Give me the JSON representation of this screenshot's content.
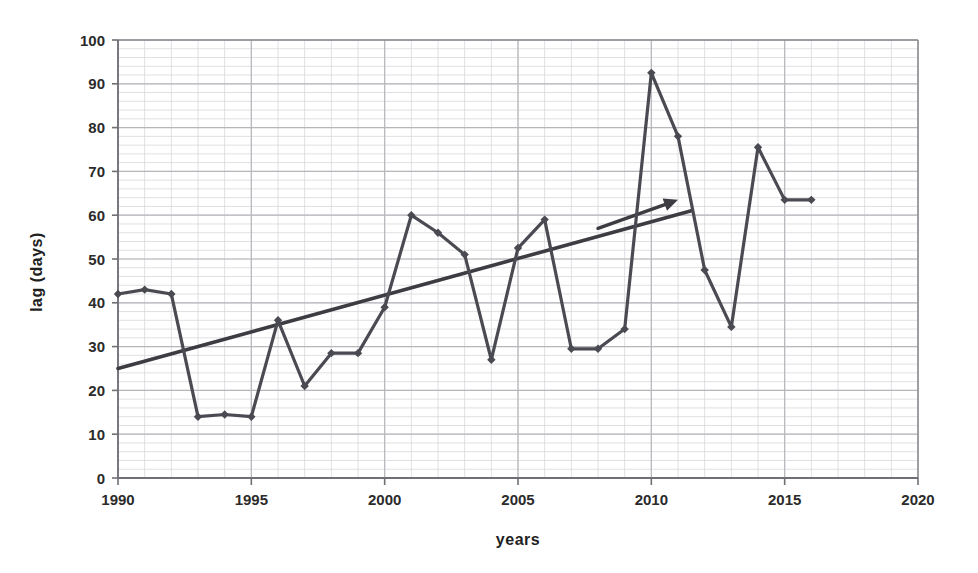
{
  "chart_data": {
    "type": "line",
    "title": "",
    "xlabel": "years",
    "ylabel": "lag (days)",
    "xlim": [
      1990,
      2020
    ],
    "ylim": [
      0,
      100
    ],
    "xticks": [
      1990,
      1995,
      2000,
      2005,
      2010,
      2015,
      2020
    ],
    "yticks": [
      0,
      10,
      20,
      30,
      40,
      50,
      60,
      70,
      80,
      90,
      100
    ],
    "grid": true,
    "legend": "none",
    "x": [
      1990,
      1991,
      1992,
      1993,
      1994,
      1995,
      1996,
      1997,
      1998,
      1999,
      2000,
      2001,
      2002,
      2003,
      2004,
      2005,
      2006,
      2007,
      2008,
      2009,
      2010,
      2011,
      2012,
      2013,
      2014,
      2015,
      2016
    ],
    "series": [
      {
        "name": "lag",
        "marker": "diamond",
        "color": "#4a4a52",
        "values": [
          42,
          43,
          42,
          14,
          14.5,
          14,
          36,
          21,
          28.5,
          28.5,
          39,
          60,
          56,
          51,
          27,
          52.5,
          59,
          29.5,
          29.5,
          34,
          92.5,
          78,
          47.5,
          34.5,
          75.5,
          63.5,
          63.5
        ]
      }
    ],
    "trendline": {
      "name": "linear-trend",
      "color": "#3c3c42",
      "x_start": 1990,
      "y_start": 25,
      "x_end": 2011.5,
      "y_end": 61
    },
    "annotations": [
      {
        "name": "trend-arrow",
        "type": "arrow",
        "color": "#3c3c42",
        "x_start": 2008.0,
        "y_start": 57,
        "x_end": 2011.0,
        "y_end": 63.5,
        "text": ""
      }
    ],
    "gridlines": {
      "minor_x_step": 1,
      "minor_y_step": 2,
      "major_x_step": 5,
      "major_y_step": 10,
      "minor_color": "#d8d8dc",
      "major_color": "#b6b6bb"
    },
    "axis_color": "#8a8a90",
    "background": "#ffffff"
  },
  "axes": {
    "x_title": "years",
    "y_title": "lag (days)",
    "x_tick_labels": [
      "1990",
      "1995",
      "2000",
      "2005",
      "2010",
      "2015",
      "2020"
    ],
    "y_tick_labels": [
      "0",
      "10",
      "20",
      "30",
      "40",
      "50",
      "60",
      "70",
      "80",
      "90",
      "100"
    ]
  },
  "figure": {
    "alt": "line chart of lag in days by year from 1990 to 2016 with rising linear trend line"
  }
}
